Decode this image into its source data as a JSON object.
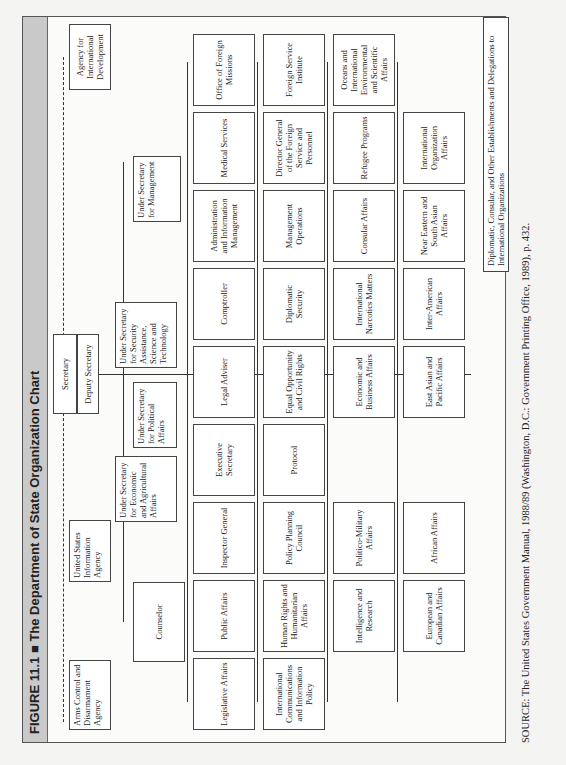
{
  "figure": {
    "title": "FIGURE 11.1 ■ The Department of State Organization Chart"
  },
  "top": {
    "arms": "Arms Control and Disarmament Agency",
    "usia": "United States Information Agency",
    "secretary": "Secretary",
    "deputy": "Deputy Secretary",
    "aid": "Agency for International Development"
  },
  "under": {
    "counselor": "Counselor",
    "econ": "Under Secretary for Economic and Agricultural Affairs",
    "political": "Under Secretary for Political Affairs",
    "security": "Under Secretary for Security Assistance, Science and Technology",
    "management": "Under Secretary for Management"
  },
  "rows": [
    [
      "Legislative Affairs",
      "Public Affairs",
      "Inspector General",
      "Executive Secretary",
      "Legal Adviser",
      "Comptroller",
      "Administration and Information Management",
      "Medical Services",
      "Office of Foreign Missions"
    ],
    [
      "International Communications and Information Policy",
      "Human Rights and Humanitarian Affairs",
      "Policy Planning Council",
      "Protocol",
      "Equal Opportunity and Civil Rights",
      "Diplomatic Security",
      "Management Operations",
      "Director General of the Foreign Service and Personnel",
      "Foreign Service Institute"
    ],
    [
      "",
      "Intelligence and Research",
      "Politico-Military Affairs",
      "",
      "Economic and Business Affairs",
      "International Narcotics Matters",
      "Consular Affairs",
      "Refugee Programs",
      "Oceans and International Environmental and Scientific Affairs"
    ],
    [
      "",
      "European and Canadian Affairs",
      "African Affairs",
      "",
      "East Asian and Pacific Affairs",
      "Inter-American Affairs",
      "Near Eastern and South Asian Affairs",
      "International Organization Affairs",
      ""
    ]
  ],
  "diplomatic": "Diplomatic, Consular, and Other Establishments and Delegations to International Organizations",
  "source": "SOURCE: The United States Government Manual, 1988/89 (Washington, D.C.: Government Printing Office, 1989), p. 432."
}
